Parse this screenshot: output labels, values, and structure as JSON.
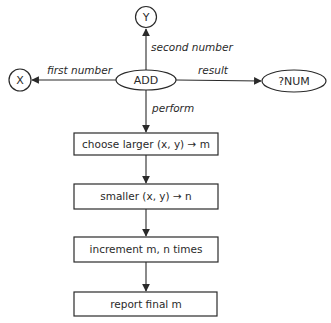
{
  "diagram": {
    "center_node": {
      "label": "ADD",
      "shape": "ellipse"
    },
    "nodes": {
      "y": {
        "label": "Y",
        "shape": "circle"
      },
      "x": {
        "label": "X",
        "shape": "circle"
      },
      "result": {
        "label": "?NUM",
        "shape": "ellipse"
      }
    },
    "edges": {
      "second_number": {
        "label": "second number",
        "from": "ADD",
        "to": "Y"
      },
      "first_number": {
        "label": "first number",
        "from": "ADD",
        "to": "X"
      },
      "result": {
        "label": "result",
        "from": "ADD",
        "to": "?NUM"
      },
      "perform": {
        "label": "perform",
        "from": "ADD",
        "to": "step1"
      }
    },
    "steps": [
      {
        "label": "choose larger (x, y) → m"
      },
      {
        "label": "smaller (x, y) → n"
      },
      {
        "label": "increment m, n times"
      },
      {
        "label": "report final m"
      }
    ],
    "colors": {
      "ink": "#2a2a2a",
      "background": "#ffffff"
    }
  }
}
